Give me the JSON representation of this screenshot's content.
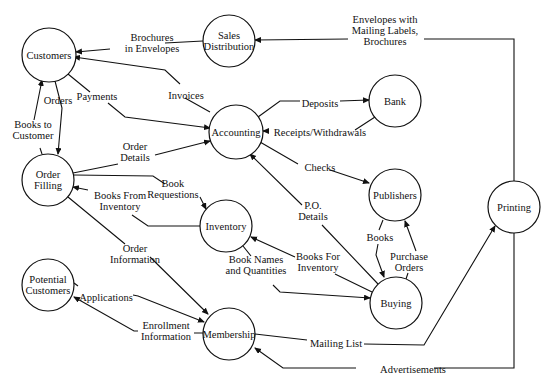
{
  "diagram": {
    "type": "data-flow-diagram",
    "nodes": [
      {
        "id": "customers",
        "label": [
          "Customers"
        ],
        "cx": 49,
        "cy": 55,
        "r": 27
      },
      {
        "id": "sales_distribution",
        "label": [
          "Sales",
          "Distribution"
        ],
        "cx": 229,
        "cy": 41,
        "r": 26
      },
      {
        "id": "accounting",
        "label": [
          "Accounting"
        ],
        "cx": 236,
        "cy": 132,
        "r": 27
      },
      {
        "id": "bank",
        "label": [
          "Bank"
        ],
        "cx": 395,
        "cy": 101,
        "r": 26
      },
      {
        "id": "order_filling",
        "label": [
          "Order",
          "Filling"
        ],
        "cx": 48,
        "cy": 180,
        "r": 26
      },
      {
        "id": "inventory",
        "label": [
          "Inventory"
        ],
        "cx": 226,
        "cy": 226,
        "r": 26
      },
      {
        "id": "publishers",
        "label": [
          "Publishers"
        ],
        "cx": 395,
        "cy": 195,
        "r": 26
      },
      {
        "id": "printing",
        "label": [
          "Printing"
        ],
        "cx": 514,
        "cy": 207,
        "r": 26
      },
      {
        "id": "potential_customers",
        "label": [
          "Potential",
          "Customers"
        ],
        "cx": 48,
        "cy": 285,
        "r": 26
      },
      {
        "id": "buying",
        "label": [
          "Buying"
        ],
        "cx": 396,
        "cy": 303,
        "r": 26
      },
      {
        "id": "membership",
        "label": [
          "Membership"
        ],
        "cx": 229,
        "cy": 334,
        "r": 26
      }
    ],
    "flows": [
      {
        "id": "brochures-in-envelopes",
        "label": [
          "Brochures",
          "in Envelopes"
        ],
        "from": "sales_distribution",
        "to": "customers",
        "label_x": 152,
        "label_y": 43,
        "points": "203,41 165,43 M 110,49 76,52",
        "arrow_end": "76,52"
      },
      {
        "id": "envelopes-with-labels",
        "label": [
          "Envelopes with",
          "Mailing Labels,",
          "Brochures"
        ],
        "from": "printing",
        "to": "sales_distribution",
        "label_x": 385,
        "label_y": 30,
        "points": "514,181 514,39 424,39 M 348,39 255,40",
        "arrow_end": "255,40"
      },
      {
        "id": "invoices",
        "label": [
          "Invoices"
        ],
        "from": "accounting",
        "to": "customers",
        "label_x": 186,
        "label_y": 95,
        "points": "210,112 185,98 M 180,84 165,70 74,57",
        "arrow_end": "74,57"
      },
      {
        "id": "payments",
        "label": [
          "Payments"
        ],
        "from": "customers",
        "to": "accounting",
        "label_x": 97,
        "label_y": 96,
        "points": "68,74 90,92 M 108,103 125,117 210,128",
        "arrow_end": "210,128"
      },
      {
        "id": "orders",
        "label": [
          "Orders"
        ],
        "from": "customers",
        "to": "order_filling",
        "label_x": 58,
        "label_y": 100,
        "points": "55,81 62,108 58,154",
        "arrow_end": "58,154"
      },
      {
        "id": "books-to-customer",
        "label": [
          "Books to",
          "Customer"
        ],
        "from": "order_filling",
        "to": "customers",
        "label_x": 33,
        "label_y": 130,
        "points": "42,154 40,148 M 34,120 42,80",
        "arrow_end": "42,80"
      },
      {
        "id": "deposits",
        "label": [
          "Deposits"
        ],
        "from": "accounting",
        "to": "bank",
        "label_x": 320,
        "label_y": 103,
        "points": "258,117 280,101 300,101 M 340,101 369,100",
        "arrow_end": "369,100"
      },
      {
        "id": "receipts-withdrawals",
        "label": [
          "Receipts/Withdrawals"
        ],
        "from": "bank",
        "to": "accounting",
        "label_x": 320,
        "label_y": 132,
        "points": "375,117 355,130 M 265,131 263,131",
        "arrow_end": "263,131"
      },
      {
        "id": "checks",
        "label": [
          "Checks"
        ],
        "from": "accounting",
        "to": "publishers",
        "label_x": 320,
        "label_y": 167,
        "points": "260,142 298,164 M 330,170 369,183",
        "arrow_end": "369,183"
      },
      {
        "id": "order-details",
        "label": [
          "Order",
          "Details"
        ],
        "from": "order_filling",
        "to": "accounting",
        "label_x": 135,
        "label_y": 152,
        "points": "73,173 118,164 M 155,155 210,141",
        "arrow_end": "210,141"
      },
      {
        "id": "book-requestions",
        "label": [
          "Book",
          "Requestions"
        ],
        "from": "order_filling",
        "to": "inventory",
        "label_x": 173,
        "label_y": 189,
        "points": "74,175 153,176 165,184 M 200,197 206,209",
        "arrow_end": "206,209"
      },
      {
        "id": "books-from-inventory",
        "label": [
          "Books From",
          "Inventory"
        ],
        "from": "inventory",
        "to": "order_filling",
        "label_x": 120,
        "label_y": 201,
        "points": "200,226 148,226 132,215 M 88,190 73,187",
        "arrow_end": "73,187"
      },
      {
        "id": "po-details",
        "label": [
          "P.O.",
          "Details"
        ],
        "from": "buying",
        "to": "accounting",
        "label_x": 313,
        "label_y": 211,
        "points": "378,284 322,225 M 302,205 250,154",
        "arrow_end": "250,154"
      },
      {
        "id": "books-for-inventory",
        "label": [
          "Books For",
          "Inventory"
        ],
        "from": "buying",
        "to": "inventory",
        "label_x": 318,
        "label_y": 262,
        "points": "372,292 335,274 M 295,257 251,237",
        "arrow_end": "251,237"
      },
      {
        "id": "book-names-quantities",
        "label": [
          "Book Names",
          "and Quantities"
        ],
        "from": "inventory",
        "to": "buying",
        "label_x": 256,
        "label_y": 265,
        "points": "243,246 251,256 M 273,285 280,292 370,298",
        "arrow_end": "370,298"
      },
      {
        "id": "books",
        "label": [
          "Books"
        ],
        "from": "publishers",
        "to": "buying",
        "label_x": 380,
        "label_y": 237,
        "points": "383,220 379,230 M 378,244 376,255 384,277",
        "arrow_end": "384,277"
      },
      {
        "id": "purchase-orders",
        "label": [
          "Purchase",
          "Orders"
        ],
        "from": "buying",
        "to": "publishers",
        "label_x": 409,
        "label_y": 262,
        "points": "406,279 408,273 M 416,251 405,221",
        "arrow_end": "405,221"
      },
      {
        "id": "order-information",
        "label": [
          "Order",
          "Information"
        ],
        "from": "order_filling",
        "to": "membership",
        "label_x": 135,
        "label_y": 254,
        "points": "68,197 125,244 M 150,257 208,314",
        "arrow_end": "208,314"
      },
      {
        "id": "applications",
        "label": [
          "Applications"
        ],
        "from": "potential_customers",
        "to": "membership",
        "label_x": 106,
        "label_y": 297,
        "points": "74,283 78,286 M 133,295 138,296 204,322",
        "arrow_end": "204,322"
      },
      {
        "id": "enrollment-information",
        "label": [
          "Enrollment",
          "Information"
        ],
        "from": "membership",
        "to": "potential_customers",
        "label_x": 166,
        "label_y": 331,
        "points": "203,333 194,333 M 138,331 134,331 74,297",
        "arrow_end": "74,297"
      },
      {
        "id": "mailing-list",
        "label": [
          "Mailing List"
        ],
        "from": "membership",
        "to": "printing",
        "label_x": 336,
        "label_y": 343,
        "points": "255,334 307,340 M 364,344 424,345 495,226",
        "arrow_end": "495,226"
      },
      {
        "id": "advertisements",
        "label": [
          "Advertisements"
        ],
        "from": "printing",
        "to": "membership",
        "label_x": 413,
        "label_y": 369,
        "points": "514,233 514,368 434,368 M 356,368 283,368 255,348",
        "arrow_end": "255,348"
      }
    ]
  }
}
